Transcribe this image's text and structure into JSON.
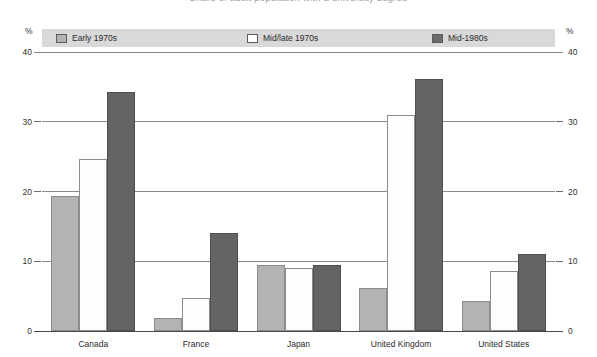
{
  "title": "Share of adult population with a university degree",
  "axis": {
    "unit_label_left": "%",
    "unit_label_right": "%",
    "ticks": [
      0,
      10,
      20,
      30,
      40
    ]
  },
  "legend": [
    {
      "label": "Early 1970s",
      "key": "early",
      "color": "#b3b3b3",
      "icon": "legend-swatch-icon"
    },
    {
      "label": "Mid/late 1970s",
      "key": "mid70",
      "color": "#ffffff",
      "icon": "legend-swatch-icon"
    },
    {
      "label": "Mid-1980s",
      "key": "mid80",
      "color": "#6b6b6b",
      "icon": "legend-swatch-icon"
    }
  ],
  "chart_data": {
    "type": "bar",
    "title": "Share of adult population with a university degree",
    "xlabel": "",
    "ylabel": "%",
    "ylim": [
      0,
      40
    ],
    "yticks": [
      0,
      10,
      20,
      30,
      40
    ],
    "grid": true,
    "legend_position": "top",
    "categories": [
      "Canada",
      "France",
      "Japan",
      "United Kingdom",
      "United States"
    ],
    "series": [
      {
        "name": "Early 1970s",
        "color": "#b3b3b3",
        "values": [
          19.3,
          1.9,
          9.4,
          6.1,
          4.3
        ]
      },
      {
        "name": "Mid/late 1970s",
        "color": "#ffffff",
        "values": [
          24.6,
          4.7,
          9.1,
          31.0,
          8.6
        ]
      },
      {
        "name": "Mid-1980s",
        "color": "#646464",
        "values": [
          34.3,
          14.1,
          9.4,
          36.1,
          11.0
        ]
      }
    ]
  }
}
